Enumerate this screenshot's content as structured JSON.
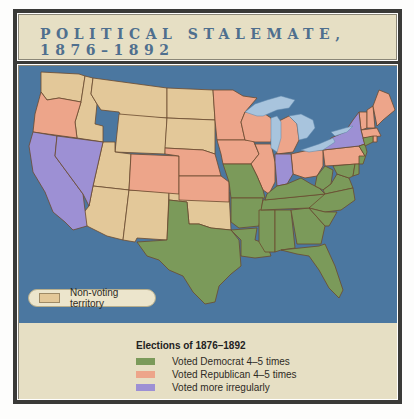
{
  "title": {
    "line1": "POLITICAL STALEMATE,",
    "line2": "1876–1892"
  },
  "map": {
    "ocean_color": "#4b77a0",
    "lake_color": "#a8c4dd",
    "border_color": "#6b4a2e",
    "non_voting_label": "Non-voting territory"
  },
  "legend": {
    "title": "Elections of 1876–1892",
    "items": [
      {
        "label": "Voted Democrat 4–5 times",
        "color": "#7b9a5a"
      },
      {
        "label": "Voted Republican 4–5 times",
        "color": "#eda58a"
      },
      {
        "label": "Voted more irregularly",
        "color": "#9d90d4"
      }
    ],
    "non_voting": {
      "label": "Non-voting territory",
      "color": "#e3c899"
    }
  },
  "regions": {
    "democrat": [
      "Texas",
      "Missouri",
      "Arkansas",
      "Louisiana",
      "Mississippi",
      "Alabama",
      "Georgia",
      "Florida",
      "Tennessee",
      "Kentucky",
      "West Virginia",
      "Virginia",
      "North Carolina",
      "South Carolina",
      "Maryland",
      "Delaware",
      "New Jersey",
      "Connecticut"
    ],
    "republican": [
      "Oregon",
      "Colorado",
      "Nebraska",
      "Kansas",
      "Minnesota",
      "Iowa",
      "Wisconsin",
      "Illinois",
      "Michigan",
      "Ohio",
      "Pennsylvania",
      "Vermont",
      "New Hampshire",
      "Maine",
      "Massachusetts",
      "Rhode Island"
    ],
    "irregular": [
      "California",
      "Nevada",
      "Indiana",
      "New York"
    ],
    "non_voting": [
      "Washington",
      "Idaho",
      "Montana",
      "Wyoming",
      "Utah",
      "Arizona",
      "New Mexico",
      "North Dakota",
      "South Dakota",
      "Oklahoma"
    ]
  }
}
